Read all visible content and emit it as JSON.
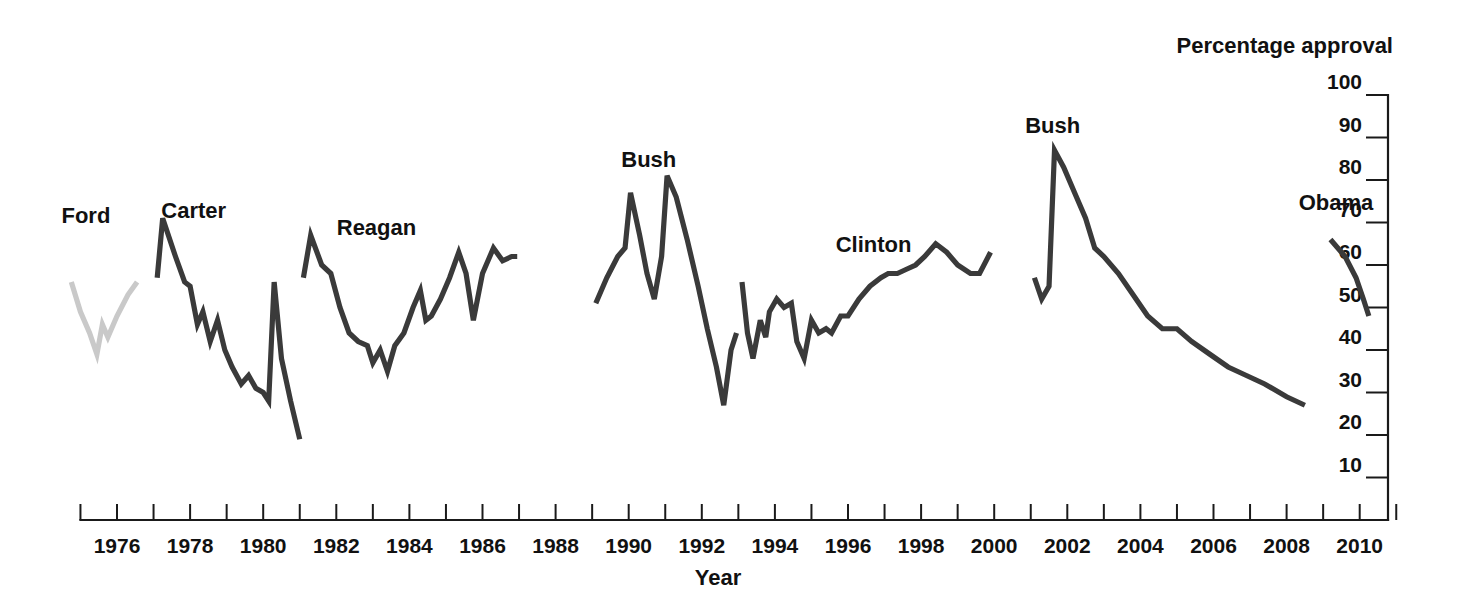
{
  "chart_data": {
    "type": "line",
    "title": "",
    "xlabel": "Year",
    "ylabel": "Percentage approval",
    "ylim": [
      0,
      100
    ],
    "xlim": [
      1974.2,
      2011.3
    ],
    "y_ticks": [
      10,
      20,
      30,
      40,
      50,
      60,
      70,
      80,
      90,
      100
    ],
    "y_tick_labels": [
      "10",
      "20",
      "30",
      "40",
      "50",
      "60",
      "70",
      "80",
      "90",
      "100"
    ],
    "y_axis_position": "right",
    "x_ticks": [
      1975,
      1976,
      1977,
      1978,
      1979,
      1980,
      1981,
      1982,
      1983,
      1984,
      1985,
      1986,
      1987,
      1988,
      1989,
      1990,
      1991,
      1992,
      1993,
      1994,
      1995,
      1996,
      1997,
      1998,
      1999,
      2000,
      2001,
      2002,
      2003,
      2004,
      2005,
      2006,
      2007,
      2008,
      2009,
      2010,
      2011
    ],
    "x_labeled_ticks": [
      1976,
      1978,
      1980,
      1982,
      1984,
      1986,
      1988,
      1990,
      1992,
      1994,
      1996,
      1998,
      2000,
      2002,
      2004,
      2006,
      2008,
      2010
    ],
    "x_tick_labels": [
      "1976",
      "1978",
      "1980",
      "1982",
      "1984",
      "1986",
      "1988",
      "1990",
      "1992",
      "1994",
      "1996",
      "1998",
      "2000",
      "2002",
      "2004",
      "2006",
      "2008",
      "2010"
    ],
    "grid": false,
    "legend": "inline-labels",
    "colors": {
      "dark_line": "#3a3a3a",
      "light_line": "#c9c9c9",
      "axis": "#1a1a1a",
      "text": "#111111",
      "background": "#ffffff"
    },
    "series": [
      {
        "name": "Ford",
        "color": "#c9c9c9",
        "label_x": 1975.15,
        "label_y": 70,
        "points": [
          [
            1974.75,
            56
          ],
          [
            1975.0,
            49
          ],
          [
            1975.25,
            44
          ],
          [
            1975.45,
            39
          ],
          [
            1975.6,
            46
          ],
          [
            1975.75,
            43
          ],
          [
            1976.0,
            48
          ],
          [
            1976.3,
            53
          ],
          [
            1976.55,
            56
          ]
        ]
      },
      {
        "name": "Carter",
        "color": "#3a3a3a",
        "label_x": 1978.1,
        "label_y": 71,
        "points": [
          [
            1977.1,
            57
          ],
          [
            1977.25,
            71
          ],
          [
            1977.6,
            62
          ],
          [
            1977.85,
            56
          ],
          [
            1978.0,
            55
          ],
          [
            1978.2,
            46
          ],
          [
            1978.35,
            49
          ],
          [
            1978.55,
            42
          ],
          [
            1978.75,
            47
          ],
          [
            1978.95,
            40
          ],
          [
            1979.15,
            36
          ],
          [
            1979.4,
            32
          ],
          [
            1979.6,
            34
          ],
          [
            1979.8,
            31
          ],
          [
            1980.0,
            30
          ],
          [
            1980.15,
            28
          ],
          [
            1980.3,
            56
          ],
          [
            1980.5,
            38
          ],
          [
            1980.75,
            28
          ],
          [
            1981.0,
            19
          ]
        ]
      },
      {
        "name": "Reagan",
        "color": "#3a3a3a",
        "label_x": 1983.1,
        "label_y": 67,
        "points": [
          [
            1981.1,
            57
          ],
          [
            1981.3,
            67
          ],
          [
            1981.6,
            60
          ],
          [
            1981.85,
            58
          ],
          [
            1982.1,
            50
          ],
          [
            1982.35,
            44
          ],
          [
            1982.6,
            42
          ],
          [
            1982.85,
            41
          ],
          [
            1983.0,
            37
          ],
          [
            1983.2,
            40
          ],
          [
            1983.4,
            35
          ],
          [
            1983.6,
            41
          ],
          [
            1983.85,
            44
          ],
          [
            1984.1,
            50
          ],
          [
            1984.3,
            54
          ],
          [
            1984.45,
            47
          ],
          [
            1984.6,
            48
          ],
          [
            1984.85,
            52
          ],
          [
            1985.1,
            57
          ],
          [
            1985.35,
            63
          ],
          [
            1985.55,
            58
          ],
          [
            1985.75,
            47
          ],
          [
            1986.0,
            58
          ],
          [
            1986.3,
            64
          ],
          [
            1986.55,
            61
          ],
          [
            1986.8,
            62
          ],
          [
            1986.95,
            62
          ]
        ]
      },
      {
        "name": "Bush",
        "color": "#3a3a3a",
        "label_x": 1990.55,
        "label_y": 83,
        "points": [
          [
            1989.1,
            51
          ],
          [
            1989.4,
            57
          ],
          [
            1989.7,
            62
          ],
          [
            1989.9,
            64
          ],
          [
            1990.05,
            77
          ],
          [
            1990.3,
            67
          ],
          [
            1990.5,
            58
          ],
          [
            1990.7,
            52
          ],
          [
            1990.9,
            62
          ],
          [
            1991.05,
            81
          ],
          [
            1991.3,
            76
          ],
          [
            1991.6,
            66
          ],
          [
            1991.9,
            55
          ],
          [
            1992.15,
            45
          ],
          [
            1992.4,
            36
          ],
          [
            1992.6,
            27
          ],
          [
            1992.8,
            40
          ],
          [
            1992.95,
            44
          ]
        ]
      },
      {
        "name": "Clinton",
        "color": "#3a3a3a",
        "label_x": 1996.7,
        "label_y": 63,
        "points": [
          [
            1993.1,
            56
          ],
          [
            1993.25,
            44
          ],
          [
            1993.4,
            38
          ],
          [
            1993.6,
            47
          ],
          [
            1993.75,
            43
          ],
          [
            1993.85,
            49
          ],
          [
            1994.05,
            52
          ],
          [
            1994.25,
            50
          ],
          [
            1994.45,
            51
          ],
          [
            1994.6,
            42
          ],
          [
            1994.8,
            38
          ],
          [
            1995.0,
            47
          ],
          [
            1995.2,
            44
          ],
          [
            1995.4,
            45
          ],
          [
            1995.55,
            44
          ],
          [
            1995.8,
            48
          ],
          [
            1996.0,
            48
          ],
          [
            1996.3,
            52
          ],
          [
            1996.6,
            55
          ],
          [
            1996.9,
            57
          ],
          [
            1997.1,
            58
          ],
          [
            1997.35,
            58
          ],
          [
            1997.6,
            59
          ],
          [
            1997.85,
            60
          ],
          [
            1998.1,
            62
          ],
          [
            1998.4,
            65
          ],
          [
            1998.7,
            63
          ],
          [
            1999.0,
            60
          ],
          [
            1999.35,
            58
          ],
          [
            1999.6,
            58
          ],
          [
            1999.9,
            63
          ]
        ]
      },
      {
        "name": "Bush",
        "color": "#3a3a3a",
        "label_x": 2001.6,
        "label_y": 91,
        "points": [
          [
            2001.1,
            57
          ],
          [
            2001.3,
            52
          ],
          [
            2001.5,
            55
          ],
          [
            2001.65,
            87
          ],
          [
            2001.9,
            83
          ],
          [
            2002.2,
            77
          ],
          [
            2002.5,
            71
          ],
          [
            2002.75,
            64
          ],
          [
            2003.0,
            62
          ],
          [
            2003.4,
            58
          ],
          [
            2003.8,
            53
          ],
          [
            2004.2,
            48
          ],
          [
            2004.6,
            45
          ],
          [
            2005.0,
            45
          ],
          [
            2005.4,
            42
          ],
          [
            2005.9,
            39
          ],
          [
            2006.4,
            36
          ],
          [
            2006.9,
            34
          ],
          [
            2007.4,
            32
          ],
          [
            2008.0,
            29
          ],
          [
            2008.5,
            27
          ]
        ]
      },
      {
        "name": "Obama",
        "color": "#3a3a3a",
        "label_x": 2009.35,
        "label_y": 73,
        "points": [
          [
            2009.2,
            66
          ],
          [
            2009.6,
            62
          ],
          [
            2009.9,
            57
          ],
          [
            2010.1,
            52
          ],
          [
            2010.25,
            48
          ]
        ]
      }
    ]
  }
}
